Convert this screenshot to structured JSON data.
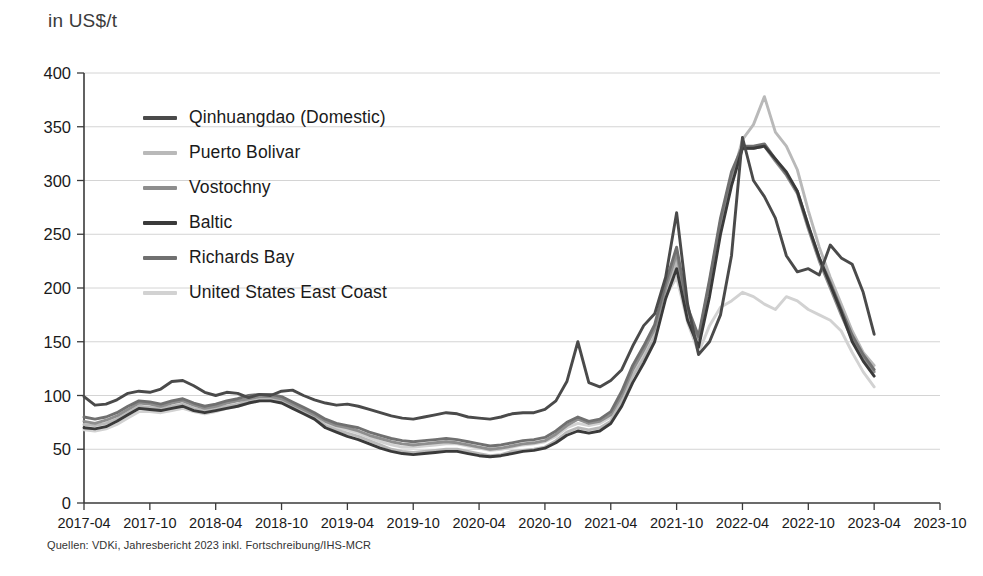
{
  "header": {
    "unit_title": "in US$/t"
  },
  "footer": {
    "source": "Quellen: VDKi, Jahresbericht 2023 inkl. Fortschreibung/IHS-MCR"
  },
  "chart_data": {
    "type": "line",
    "title": "in US$/t",
    "xlabel": "",
    "ylabel": "in US$/t",
    "ylim": [
      0,
      400
    ],
    "ytick_step": 50,
    "yticks": [
      0,
      50,
      100,
      150,
      200,
      250,
      300,
      350,
      400
    ],
    "grid": true,
    "legend_position": "upper-left-inside",
    "xtick_labels": [
      "2017-04",
      "2017-10",
      "2018-04",
      "2018-10",
      "2019-04",
      "2019-10",
      "2020-04",
      "2020-10",
      "2021-04",
      "2021-10",
      "2022-04",
      "2022-10",
      "2023-04",
      "2023-10"
    ],
    "x_start": "2017-04",
    "x_end": "2023-10",
    "x_step_months": 1,
    "x": [
      "2017-04",
      "2017-05",
      "2017-06",
      "2017-07",
      "2017-08",
      "2017-09",
      "2017-10",
      "2017-11",
      "2017-12",
      "2018-01",
      "2018-02",
      "2018-03",
      "2018-04",
      "2018-05",
      "2018-06",
      "2018-07",
      "2018-08",
      "2018-09",
      "2018-10",
      "2018-11",
      "2018-12",
      "2019-01",
      "2019-02",
      "2019-03",
      "2019-04",
      "2019-05",
      "2019-06",
      "2019-07",
      "2019-08",
      "2019-09",
      "2019-10",
      "2019-11",
      "2019-12",
      "2020-01",
      "2020-02",
      "2020-03",
      "2020-04",
      "2020-05",
      "2020-06",
      "2020-07",
      "2020-08",
      "2020-09",
      "2020-10",
      "2020-11",
      "2020-12",
      "2021-01",
      "2021-02",
      "2021-03",
      "2021-04",
      "2021-05",
      "2021-06",
      "2021-07",
      "2021-08",
      "2021-09",
      "2021-10",
      "2021-11",
      "2021-12",
      "2022-01",
      "2022-02",
      "2022-03",
      "2022-04",
      "2022-05",
      "2022-06",
      "2022-07",
      "2022-08",
      "2022-09",
      "2022-10",
      "2022-11",
      "2022-12",
      "2023-01",
      "2023-02",
      "2023-03",
      "2023-04"
    ],
    "series": [
      {
        "name": "Qinhuangdao (Domestic)",
        "color": "#4a4a4a",
        "values": [
          99,
          91,
          92,
          96,
          102,
          104,
          103,
          106,
          113,
          114,
          109,
          103,
          100,
          103,
          102,
          98,
          101,
          100,
          104,
          105,
          100,
          96,
          93,
          91,
          92,
          90,
          87,
          84,
          81,
          79,
          78,
          80,
          82,
          84,
          83,
          80,
          79,
          78,
          80,
          83,
          84,
          84,
          87,
          95,
          113,
          150,
          112,
          108,
          114,
          124,
          146,
          165,
          176,
          210,
          270,
          185,
          138,
          150,
          175,
          230,
          340,
          300,
          285,
          265,
          230,
          215,
          218,
          212,
          240,
          228,
          222,
          196,
          157
        ]
      },
      {
        "name": "Puerto Bolivar",
        "color": "#b9b9b9",
        "values": [
          73,
          72,
          74,
          78,
          84,
          90,
          89,
          88,
          90,
          92,
          88,
          86,
          88,
          90,
          92,
          95,
          97,
          97,
          95,
          90,
          85,
          80,
          72,
          68,
          65,
          62,
          58,
          54,
          50,
          48,
          47,
          48,
          49,
          50,
          50,
          48,
          46,
          44,
          45,
          48,
          49,
          50,
          52,
          58,
          66,
          70,
          68,
          70,
          76,
          95,
          118,
          135,
          155,
          195,
          225,
          175,
          150,
          200,
          258,
          300,
          338,
          352,
          378,
          345,
          332,
          310,
          272,
          238,
          210,
          185,
          160,
          140,
          128
        ]
      },
      {
        "name": "Vostochny",
        "color": "#8e8e8e",
        "values": [
          76,
          74,
          77,
          81,
          87,
          93,
          92,
          90,
          93,
          95,
          91,
          88,
          90,
          93,
          95,
          97,
          99,
          99,
          97,
          92,
          87,
          82,
          76,
          72,
          70,
          67,
          63,
          60,
          57,
          55,
          54,
          55,
          56,
          57,
          56,
          54,
          52,
          50,
          51,
          53,
          55,
          56,
          58,
          64,
          72,
          78,
          74,
          76,
          82,
          100,
          124,
          142,
          162,
          200,
          232,
          180,
          153,
          205,
          262,
          305,
          330,
          330,
          332,
          318,
          305,
          288,
          255,
          225,
          200,
          175,
          152,
          136,
          122
        ]
      },
      {
        "name": "Baltic",
        "color": "#3a3a3a",
        "values": [
          70,
          69,
          71,
          76,
          82,
          88,
          87,
          86,
          88,
          90,
          86,
          84,
          86,
          88,
          90,
          93,
          95,
          95,
          93,
          88,
          83,
          78,
          70,
          66,
          62,
          59,
          55,
          51,
          48,
          46,
          45,
          46,
          47,
          48,
          48,
          46,
          44,
          43,
          44,
          46,
          48,
          49,
          51,
          56,
          63,
          67,
          65,
          67,
          74,
          90,
          112,
          130,
          150,
          190,
          218,
          170,
          145,
          192,
          250,
          295,
          330,
          330,
          332,
          320,
          308,
          290,
          258,
          228,
          203,
          178,
          150,
          132,
          118
        ]
      },
      {
        "name": "Richards Bay",
        "color": "#707070",
        "values": [
          80,
          78,
          80,
          84,
          90,
          95,
          94,
          92,
          95,
          97,
          93,
          90,
          92,
          95,
          97,
          100,
          101,
          101,
          99,
          94,
          89,
          84,
          78,
          74,
          72,
          70,
          66,
          63,
          60,
          58,
          57,
          58,
          59,
          60,
          59,
          57,
          55,
          53,
          54,
          56,
          58,
          59,
          61,
          67,
          75,
          80,
          76,
          78,
          85,
          104,
          128,
          146,
          166,
          205,
          238,
          182,
          155,
          208,
          265,
          308,
          332,
          332,
          334,
          320,
          306,
          290,
          258,
          228,
          205,
          180,
          156,
          138,
          124
        ]
      },
      {
        "name": "United States East Coast",
        "color": "#d2d2d2",
        "values": [
          68,
          67,
          69,
          73,
          79,
          85,
          85,
          84,
          86,
          88,
          85,
          83,
          85,
          88,
          90,
          93,
          95,
          96,
          94,
          90,
          86,
          82,
          75,
          70,
          68,
          65,
          61,
          57,
          54,
          52,
          52,
          53,
          54,
          55,
          55,
          53,
          51,
          49,
          50,
          52,
          54,
          55,
          57,
          62,
          70,
          74,
          72,
          74,
          80,
          98,
          122,
          140,
          160,
          192,
          210,
          168,
          140,
          165,
          182,
          188,
          196,
          192,
          185,
          180,
          192,
          188,
          180,
          175,
          170,
          160,
          140,
          122,
          108
        ]
      }
    ]
  },
  "legend": {
    "items": [
      {
        "label": "Qinhuangdao (Domestic)",
        "color": "#4a4a4a"
      },
      {
        "label": "Puerto Bolivar",
        "color": "#b9b9b9"
      },
      {
        "label": "Vostochny",
        "color": "#8e8e8e"
      },
      {
        "label": "Baltic",
        "color": "#3a3a3a"
      },
      {
        "label": "Richards Bay",
        "color": "#707070"
      },
      {
        "label": "United States East Coast",
        "color": "#d2d2d2"
      }
    ]
  }
}
